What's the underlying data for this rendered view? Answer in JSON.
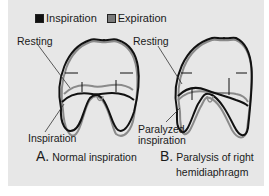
{
  "legend": {
    "items": [
      {
        "label": "Inspiration",
        "color": "#111111"
      },
      {
        "label": "Expiration",
        "color": "#7a7a7a"
      }
    ]
  },
  "panel_a": {
    "label_resting": "Resting",
    "label_inspiration": "Inspiration",
    "caption_letter": "A.",
    "caption_text": "Normal inspiration"
  },
  "panel_b": {
    "label_resting": "Resting",
    "label_inspiration_line1": "Paralyzed",
    "label_inspiration_line2": "inspiration",
    "caption_letter": "B.",
    "caption_text_line1": "Paralysis of right",
    "caption_text_line2": "hemidiaphragm"
  },
  "colors": {
    "panel_bg": "#e7e7e7",
    "inspiration_stroke": "#111111",
    "expiration_stroke": "#8a8a8a"
  }
}
